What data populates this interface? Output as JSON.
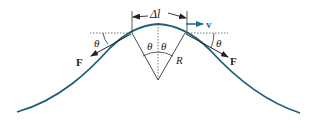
{
  "diagram": {
    "labels": {
      "delta_l": "Δl",
      "velocity": "v",
      "force_left": "F",
      "force_right": "F",
      "theta_outer_left": "θ",
      "theta_inner_left": "θ",
      "theta_inner_right": "θ",
      "theta_outer_right": "θ",
      "radius": "R"
    },
    "colors": {
      "curve": "#1f5f7a",
      "velocity_arrow": "#1f6f8f",
      "lines": "#333333",
      "text": "#222222"
    }
  }
}
